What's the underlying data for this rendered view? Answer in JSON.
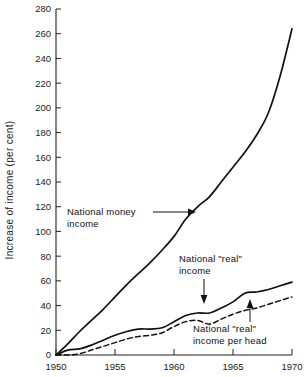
{
  "chart_data": {
    "type": "line",
    "title": "",
    "xlabel": "",
    "ylabel": "Increase of income (per cent)",
    "xlim": [
      1950,
      1970
    ],
    "ylim": [
      0,
      280
    ],
    "grid": false,
    "legend_position": "inline-annotations",
    "x_ticks": [
      "1950",
      "1955",
      "1960",
      "1965",
      "1970"
    ],
    "x_tick_values": [
      1950,
      1955,
      1960,
      1965,
      1970
    ],
    "y_ticks": [
      "0",
      "20",
      "40",
      "60",
      "80",
      "100",
      "120",
      "140",
      "160",
      "180",
      "200",
      "220",
      "240",
      "260",
      "280"
    ],
    "y_tick_values": [
      0,
      20,
      40,
      60,
      80,
      100,
      120,
      140,
      160,
      180,
      200,
      220,
      240,
      260,
      280
    ],
    "x": [
      1950,
      1951,
      1952,
      1953,
      1954,
      1955,
      1956,
      1957,
      1958,
      1959,
      1960,
      1961,
      1962,
      1963,
      1964,
      1965,
      1966,
      1967,
      1968,
      1969,
      1970
    ],
    "series": [
      {
        "name": "National money income",
        "style": "solid",
        "color": "#111111",
        "values": [
          0,
          9,
          19,
          28,
          37,
          47,
          57,
          66,
          75,
          85,
          96,
          110,
          120,
          128,
          140,
          152,
          164,
          178,
          196,
          226,
          264
        ]
      },
      {
        "name": "National \"real\" income",
        "style": "solid",
        "color": "#111111",
        "values": [
          0,
          4,
          5,
          8,
          12,
          16,
          19,
          21,
          21,
          22,
          27,
          32,
          34,
          34,
          38,
          43,
          50,
          51,
          53,
          56,
          59
        ]
      },
      {
        "name": "National \"real\" income per head",
        "style": "dashed",
        "color": "#111111",
        "values": [
          0,
          0,
          1,
          4,
          7,
          10,
          13,
          15,
          16,
          18,
          23,
          27,
          28,
          25,
          29,
          33,
          36,
          38,
          41,
          44,
          47
        ]
      }
    ],
    "annotations": [
      {
        "id": "money-income",
        "text_line1": "National money",
        "text_line2": "income",
        "arrow": "right",
        "points_to_series": "National money income"
      },
      {
        "id": "real-income",
        "text_line1": "National \"real\"",
        "text_line2": "income",
        "arrow": "down",
        "points_to_series": "National \"real\" income"
      },
      {
        "id": "real-income-per-head",
        "text_line1": "National \"real\"",
        "text_line2": "income per head",
        "arrow": "up",
        "points_to_series": "National \"real\" income per head"
      }
    ]
  },
  "colors": {
    "axis": "#222222",
    "line": "#111111",
    "background": "#ffffff"
  }
}
